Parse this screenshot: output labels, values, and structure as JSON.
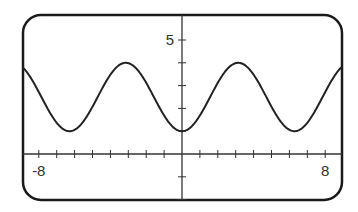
{
  "chart_data": {
    "type": "line",
    "title": "",
    "xlabel": "",
    "ylabel": "",
    "function": "y = 2.5 - 1.5*cos(x)",
    "xlim": [
      -8.9,
      8.9
    ],
    "ylim": [
      -2.5,
      6.1
    ],
    "x_tick_step": 1,
    "y_tick_step": 1,
    "x_tick_labels": [
      {
        "value": -8,
        "label": "-8"
      },
      {
        "value": 8,
        "label": "8"
      }
    ],
    "y_tick_labels": [
      {
        "value": 5,
        "label": "5"
      }
    ],
    "grid": false,
    "series": [
      {
        "name": "curve",
        "x": [
          -8.9,
          -8,
          -7,
          -6.28,
          -6,
          -5,
          -4,
          -3.14,
          -3,
          -2,
          -1,
          0,
          1,
          2,
          3,
          3.14,
          4,
          5,
          6,
          6.28,
          7,
          8,
          8.9
        ],
        "y": [
          3.79,
          2.72,
          1.37,
          1.0,
          1.06,
          2.07,
          3.48,
          4.0,
          3.98,
          3.12,
          1.69,
          1.0,
          1.69,
          3.12,
          3.98,
          4.0,
          3.48,
          2.07,
          1.06,
          1.0,
          1.37,
          2.72,
          3.79
        ]
      }
    ],
    "colors": {
      "line": "#222222",
      "frame": "#1a1a1a",
      "axis": "#333333"
    }
  }
}
